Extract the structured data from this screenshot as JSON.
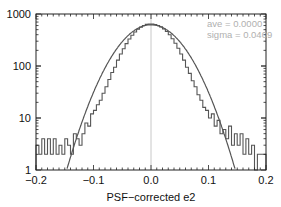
{
  "chart_data": {
    "type": "histogram",
    "title": "",
    "xlabel": "PSF−corrected e2",
    "ylabel": "",
    "xlim": [
      -0.2,
      0.2
    ],
    "ylim": [
      1,
      1000
    ],
    "yscale": "log",
    "x_ticks": [
      -0.2,
      -0.1,
      0.0,
      0.1,
      0.2
    ],
    "x_tick_labels": [
      "−0.2",
      "−0.1",
      "0.0",
      "0.1",
      "0.2"
    ],
    "y_ticks": [
      1,
      10,
      100,
      1000
    ],
    "y_tick_labels": [
      "1",
      "10",
      "100",
      "1000"
    ],
    "grid": false,
    "annotations": [
      "ave = 0.0000",
      "sigma = 0.0409"
    ],
    "reference_line": {
      "x": 0.0,
      "color": "#c8c8c8"
    },
    "gaussian_fit": {
      "mean": 0.0,
      "sigma": 0.0409,
      "peak": 620,
      "color": "#555555"
    },
    "histogram": {
      "bin_width": 0.005,
      "color": "#555555",
      "bins": [
        [
          -0.2,
          3
        ],
        [
          -0.195,
          2
        ],
        [
          -0.19,
          4
        ],
        [
          -0.185,
          2
        ],
        [
          -0.18,
          4
        ],
        [
          -0.175,
          2
        ],
        [
          -0.17,
          4
        ],
        [
          -0.165,
          2
        ],
        [
          -0.16,
          3
        ],
        [
          -0.155,
          2
        ],
        [
          -0.15,
          4
        ],
        [
          -0.145,
          3
        ],
        [
          -0.14,
          2
        ],
        [
          -0.135,
          5
        ],
        [
          -0.13,
          4
        ],
        [
          -0.125,
          3
        ],
        [
          -0.12,
          5
        ],
        [
          -0.115,
          8
        ],
        [
          -0.11,
          7
        ],
        [
          -0.105,
          12
        ],
        [
          -0.1,
          14
        ],
        [
          -0.095,
          18
        ],
        [
          -0.09,
          22
        ],
        [
          -0.085,
          30
        ],
        [
          -0.08,
          40
        ],
        [
          -0.075,
          55
        ],
        [
          -0.07,
          75
        ],
        [
          -0.065,
          95
        ],
        [
          -0.06,
          130
        ],
        [
          -0.055,
          170
        ],
        [
          -0.05,
          215
        ],
        [
          -0.045,
          270
        ],
        [
          -0.04,
          330
        ],
        [
          -0.035,
          390
        ],
        [
          -0.03,
          450
        ],
        [
          -0.025,
          510
        ],
        [
          -0.02,
          560
        ],
        [
          -0.015,
          600
        ],
        [
          -0.01,
          630
        ],
        [
          -0.005,
          640
        ],
        [
          0.0,
          640
        ],
        [
          0.005,
          625
        ],
        [
          0.01,
          600
        ],
        [
          0.015,
          565
        ],
        [
          0.02,
          515
        ],
        [
          0.025,
          460
        ],
        [
          0.03,
          400
        ],
        [
          0.035,
          335
        ],
        [
          0.04,
          275
        ],
        [
          0.045,
          220
        ],
        [
          0.05,
          170
        ],
        [
          0.055,
          130
        ],
        [
          0.06,
          95
        ],
        [
          0.065,
          72
        ],
        [
          0.07,
          52
        ],
        [
          0.075,
          40
        ],
        [
          0.08,
          28
        ],
        [
          0.085,
          22
        ],
        [
          0.09,
          16
        ],
        [
          0.095,
          14
        ],
        [
          0.1,
          10
        ],
        [
          0.105,
          12
        ],
        [
          0.11,
          7
        ],
        [
          0.115,
          9
        ],
        [
          0.12,
          5
        ],
        [
          0.125,
          6
        ],
        [
          0.13,
          4
        ],
        [
          0.135,
          7
        ],
        [
          0.14,
          3
        ],
        [
          0.145,
          5
        ],
        [
          0.15,
          3
        ],
        [
          0.155,
          5
        ],
        [
          0.16,
          2
        ],
        [
          0.165,
          4
        ],
        [
          0.17,
          2
        ],
        [
          0.175,
          3
        ],
        [
          0.18,
          1
        ],
        [
          0.185,
          2
        ],
        [
          0.19,
          2
        ],
        [
          0.195,
          2
        ]
      ]
    }
  },
  "labels": {
    "xlabel": "PSF−corrected e2",
    "annot_ave": "ave = 0.0000",
    "annot_sigma": "sigma = 0.0409",
    "x_ticks": [
      "−0.2",
      "−0.1",
      "0.0",
      "0.1",
      "0.2"
    ],
    "y_ticks": [
      "1",
      "10",
      "100",
      "1000"
    ]
  }
}
